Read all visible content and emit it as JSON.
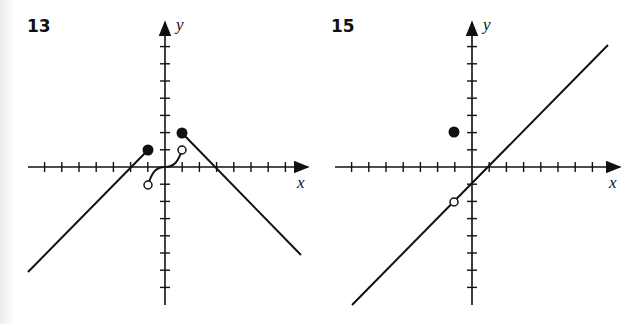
{
  "chart_data": [
    {
      "type": "line",
      "title": "13",
      "xlabel": "x",
      "ylabel": "y",
      "xlim": [
        -7,
        7
      ],
      "ylim": [
        -8,
        8
      ],
      "grid": false,
      "tick_spacing": 1,
      "series": [
        {
          "name": "left-ray",
          "points": [
            [
              -8,
              -6
            ],
            [
              -1,
              1
            ]
          ],
          "equation": "y = x + 2",
          "endpoint": {
            "x": -1,
            "y": 1,
            "type": "closed"
          }
        },
        {
          "name": "middle-curve",
          "points": [
            [
              -1,
              -1
            ],
            [
              0,
              0
            ],
            [
              1,
              1
            ]
          ],
          "shape": "cubic",
          "start": {
            "x": -1,
            "y": -1,
            "type": "open"
          },
          "end": {
            "x": 1,
            "y": 1,
            "type": "open"
          }
        },
        {
          "name": "right-ray",
          "points": [
            [
              1,
              2
            ],
            [
              8,
              -5
            ]
          ],
          "equation": "y = -x + 3",
          "endpoint": {
            "x": 1,
            "y": 2,
            "type": "closed"
          }
        }
      ]
    },
    {
      "type": "line",
      "title": "15",
      "xlabel": "x",
      "ylabel": "y",
      "xlim": [
        -7,
        7
      ],
      "ylim": [
        -8,
        8
      ],
      "grid": false,
      "tick_spacing": 1,
      "series": [
        {
          "name": "line",
          "points": [
            [
              -7,
              -8
            ],
            [
              8,
              7
            ]
          ],
          "equation": "y = x - 1",
          "hole": {
            "x": -1,
            "y": -2,
            "type": "open"
          }
        },
        {
          "name": "isolated-point",
          "points": [
            [
              -1,
              2
            ]
          ],
          "type": "closed"
        }
      ]
    }
  ],
  "labels": {
    "g13": "13",
    "g15": "15",
    "x": "x",
    "y": "y"
  }
}
